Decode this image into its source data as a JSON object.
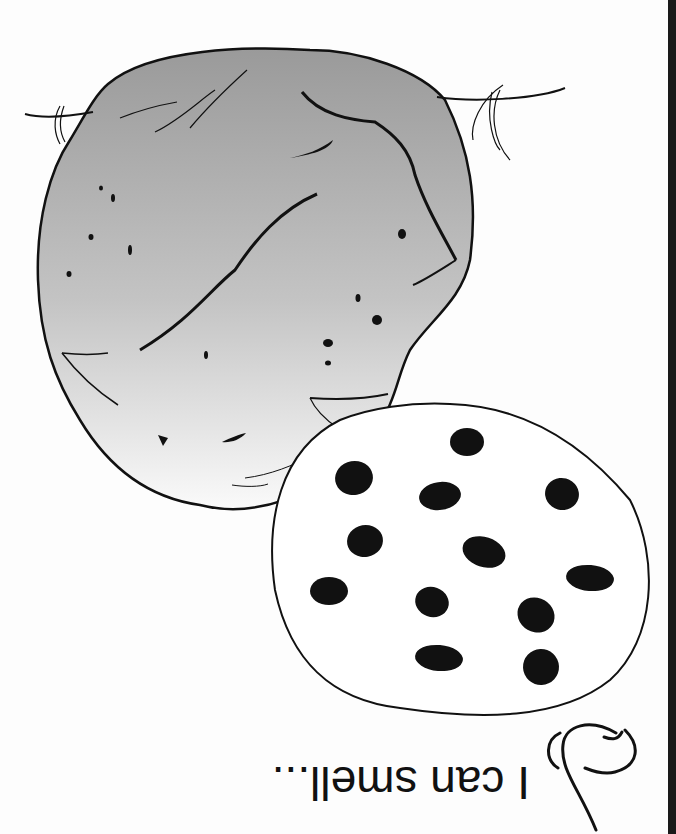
{
  "worksheet": {
    "orientation": "upside-down",
    "caption": "I can smell...",
    "illustrations": [
      {
        "name": "bread-loaf",
        "fill": "gradient-gray",
        "stroke": "#111111"
      },
      {
        "name": "chocolate-chip-cookie",
        "chip_count": 12,
        "stroke": "#111111",
        "chip_color": "#111111"
      },
      {
        "name": "nose",
        "stroke": "#111111"
      }
    ],
    "edge_bar_color": "#1a1a1a"
  }
}
